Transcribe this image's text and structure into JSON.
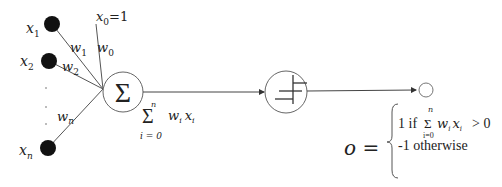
{
  "diagram": {
    "inputs": [
      {
        "label": "x",
        "sub": "1"
      },
      {
        "label": "x",
        "sub": "2"
      },
      {
        "label": "x",
        "sub": "n"
      }
    ],
    "bias": {
      "label": "x",
      "sub": "0",
      "suffix": "=1"
    },
    "weights": [
      {
        "label": "w",
        "sub": "1"
      },
      {
        "label": "w",
        "sub": "2"
      },
      {
        "label": "w",
        "sub": "n"
      },
      {
        "label": "w",
        "sub": "0"
      }
    ],
    "ellipsis": "· · ·",
    "summation_node": {
      "symbol": "Σ"
    },
    "sum_expression": {
      "sigma": "Σ",
      "upper": "n",
      "lower": "i = 0",
      "term": "w",
      "term_sub": "i",
      "var": "x",
      "var_sub": "i"
    },
    "activation_node": {
      "type": "step-function"
    },
    "output": {
      "label": "o =",
      "case1_prefix": "1 if",
      "case1_sigma": "Σ",
      "case1_upper": "n",
      "case1_lower": "i=0",
      "case1_term": "w",
      "case1_term_sub": "i",
      "case1_var": "x",
      "case1_var_sub": "i",
      "case1_cond": "> 0",
      "case2": "-1 otherwise"
    }
  }
}
